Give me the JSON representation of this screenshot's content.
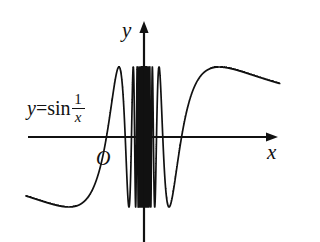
{
  "figure": {
    "background_color": "#ffffff",
    "curve_color": "#111111",
    "axis_color": "#111111"
  },
  "labels": {
    "y_axis": "y",
    "x_axis": "x",
    "origin": "O",
    "function_lhs": "y",
    "function_equals": "=",
    "function_sin": "sin",
    "function_numerator": "1",
    "function_denominator": "x",
    "function_full": "y=sin(1/x)"
  },
  "chart_data": {
    "type": "line",
    "xlabel": "x",
    "ylabel": "y",
    "legend": [
      "y=sin(1/x)"
    ],
    "grid": false,
    "xlim": [
      -1.0,
      1.15
    ],
    "ylim": [
      -1.35,
      1.35
    ],
    "expression": "y = sin(1/x)",
    "asymptotic_note": "Infinitely dense oscillations as x approaches 0",
    "axes": {
      "x_axis_arrow": "right",
      "y_axis_arrow": "up",
      "x_axis_y_value": 0,
      "y_axis_x_value": 0
    },
    "features": [
      {
        "name": "left tail asymptote",
        "x_range": [
          -1.0,
          -0.55
        ],
        "y_approx": -0.92
      },
      {
        "name": "left rise through origin level",
        "x_approx": -0.32,
        "y_approx": 0
      },
      {
        "name": "leftmost tall peak",
        "x_approx": -0.25,
        "y_approx": 1.0
      },
      {
        "name": "dense oscillation band",
        "x_range": [
          -0.11,
          0.11
        ],
        "y_range": [
          -1.0,
          1.0
        ]
      },
      {
        "name": "rightmost deep trough",
        "x_approx": 0.145,
        "y_approx": -1.0
      },
      {
        "name": "right tail maximum",
        "x_approx": 0.52,
        "y_approx": 1.0
      },
      {
        "name": "right tail end",
        "x_approx": 1.1,
        "y_approx": 0.86
      }
    ],
    "sampled_points": [
      {
        "x": -1.0,
        "y": -0.841
      },
      {
        "x": -0.9,
        "y": -0.879
      },
      {
        "x": -0.8,
        "y": -0.949
      },
      {
        "x": -0.7,
        "y": -0.99
      },
      {
        "x": -0.6,
        "y": -0.995
      },
      {
        "x": -0.5,
        "y": -0.909
      },
      {
        "x": -0.45,
        "y": -0.791
      },
      {
        "x": -0.4,
        "y": -0.598
      },
      {
        "x": -0.35,
        "y": -0.292
      },
      {
        "x": -0.32,
        "y": -0.033
      },
      {
        "x": -0.3,
        "y": 0.19
      },
      {
        "x": -0.28,
        "y": 0.454
      },
      {
        "x": -0.25,
        "y": 0.757
      },
      {
        "x": -0.22,
        "y": 0.99
      },
      {
        "x": -0.2,
        "y": 0.959
      },
      {
        "x": -0.18,
        "y": 0.752
      },
      {
        "x": -0.16,
        "y": 0.363
      },
      {
        "x": -0.14,
        "y": -0.218
      },
      {
        "x": -0.12,
        "y": -0.903
      },
      {
        "x": -0.11,
        "y": -1.0
      },
      {
        "x": 0.11,
        "y": 1.0
      },
      {
        "x": 0.12,
        "y": 0.903
      },
      {
        "x": 0.14,
        "y": 0.218
      },
      {
        "x": 0.16,
        "y": -0.363
      },
      {
        "x": 0.18,
        "y": -0.752
      },
      {
        "x": 0.2,
        "y": -0.959
      },
      {
        "x": 0.22,
        "y": -0.99
      },
      {
        "x": 0.25,
        "y": -0.757
      },
      {
        "x": 0.28,
        "y": -0.454
      },
      {
        "x": 0.3,
        "y": -0.19
      },
      {
        "x": 0.32,
        "y": 0.033
      },
      {
        "x": 0.36,
        "y": 0.395
      },
      {
        "x": 0.4,
        "y": 0.598
      },
      {
        "x": 0.45,
        "y": 0.791
      },
      {
        "x": 0.5,
        "y": 0.909
      },
      {
        "x": 0.6,
        "y": 0.995
      },
      {
        "x": 0.7,
        "y": 0.99
      },
      {
        "x": 0.8,
        "y": 0.949
      },
      {
        "x": 0.9,
        "y": 0.879
      },
      {
        "x": 1.0,
        "y": 0.841
      },
      {
        "x": 1.1,
        "y": 0.808
      }
    ]
  }
}
